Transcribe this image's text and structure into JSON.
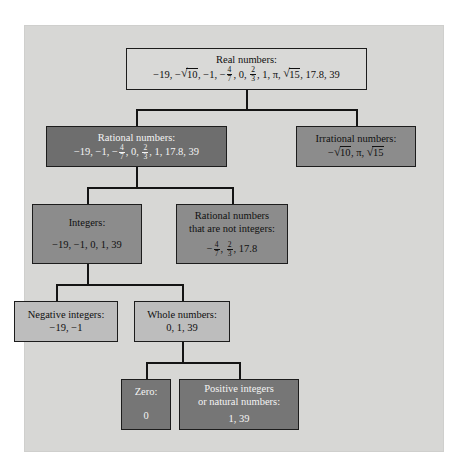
{
  "diagram": {
    "colors": {
      "panel_background": "#d7d7d5",
      "box_white": "#d9d9d7",
      "box_dark": "#6e6e6e",
      "box_light": "#bdbdbd",
      "box_medium": "#8c8c8c",
      "box_medium_dark": "#767676",
      "line": "#141414",
      "text_dark": "#101010",
      "text_light": "#f4f4f4"
    },
    "nodes": {
      "real_numbers": {
        "title": "Real numbers:",
        "values": "−19, −√10, −1, −4/7, 0, 2/3, 1, π, √15, 17.8, 39"
      },
      "rational_numbers": {
        "title": "Rational numbers:",
        "values": "−19, −1, −4/7, 0, 2/3, 1, 17.8, 39"
      },
      "irrational_numbers": {
        "title": "Irrational numbers:",
        "values": "−√10, π, √15"
      },
      "integers": {
        "title": "Integers:",
        "values": "−19, −1, 0, 1, 39"
      },
      "rational_not_integers": {
        "title_line1": "Rational numbers",
        "title_line2": "that are not integers:",
        "values": "−4/7, 2/3, 17.8"
      },
      "negative_integers": {
        "title": "Negative integers:",
        "values": "−19, −1"
      },
      "whole_numbers": {
        "title": "Whole numbers:",
        "values": "0, 1, 39"
      },
      "zero": {
        "title": "Zero:",
        "values": "0"
      },
      "positive_integers": {
        "title_line1": "Positive integers",
        "title_line2": "or natural numbers:",
        "values": "1, 39"
      }
    }
  }
}
